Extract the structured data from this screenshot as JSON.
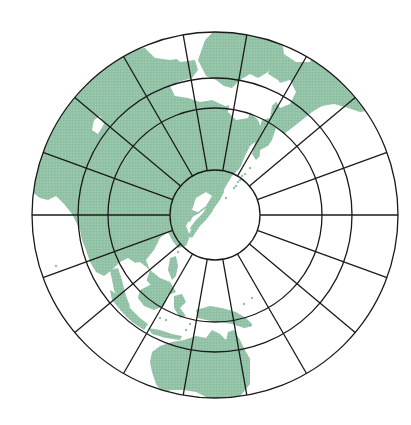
{
  "map": {
    "projection": "azimuthal",
    "center_region": "Japan",
    "colors": {
      "land": "#94c4a8",
      "water": "#ffffff",
      "grid": "#1a1a1a"
    },
    "grid": {
      "center": [
        215,
        215
      ],
      "ring_radii": [
        45,
        107,
        137,
        183
      ],
      "radial_line_step_deg": 20,
      "radial_line_count": 18
    },
    "regions": [
      {
        "name": "Japan",
        "location": "center"
      },
      {
        "name": "East Asia",
        "location": "upper-left"
      },
      {
        "name": "Russia / Siberia",
        "location": "top"
      },
      {
        "name": "Alaska / North America",
        "location": "upper-right"
      },
      {
        "name": "South Asia / India",
        "location": "left"
      },
      {
        "name": "Southeast Asia / Indonesia",
        "location": "lower-left"
      },
      {
        "name": "New Guinea",
        "location": "bottom"
      },
      {
        "name": "Australia",
        "location": "bottom"
      },
      {
        "name": "Pacific Islands",
        "location": "lower-right"
      }
    ]
  }
}
